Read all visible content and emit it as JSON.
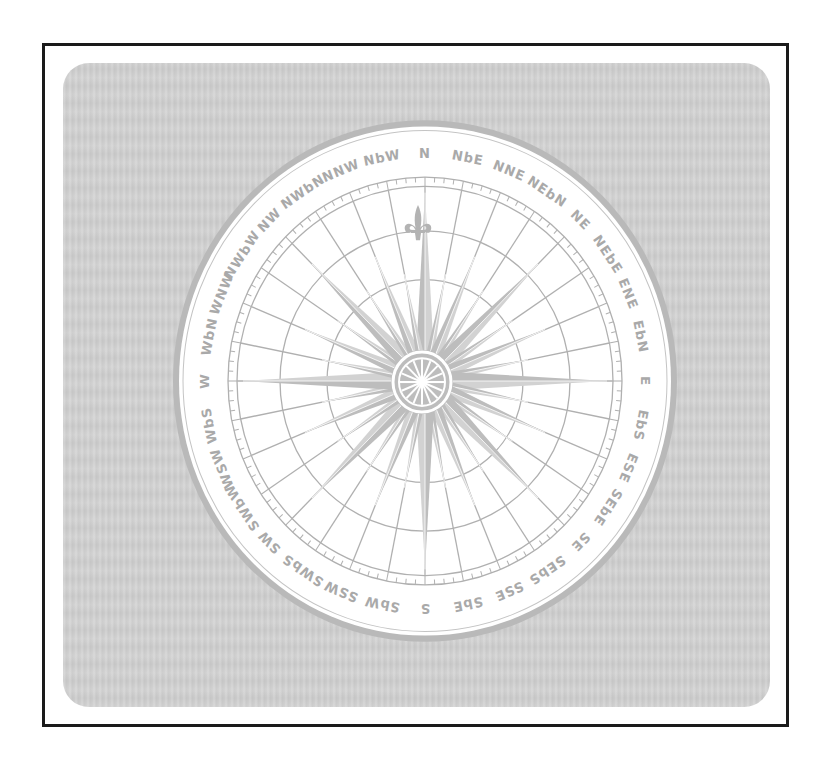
{
  "figure": {
    "colors": {
      "frame_border": "#1a1a1a",
      "panel_background": "#d1d1d1",
      "card_fill": "#ffffff",
      "line_color": "#b0b0b0",
      "label_color": "#a9a9a9",
      "ray_fill": "#bdbdbd"
    },
    "north_marker_icon": "fleur-de-lis-icon",
    "points": [
      "N",
      "NbE",
      "NNE",
      "NEbN",
      "NE",
      "NEbE",
      "ENE",
      "EbN",
      "E",
      "EbS",
      "ESE",
      "SEbE",
      "SE",
      "SEbS",
      "SSE",
      "SbE",
      "S",
      "SbW",
      "SSW",
      "SWbS",
      "SW",
      "SWbW",
      "WSW",
      "WbS",
      "W",
      "WbN",
      "WNW",
      "NWbW",
      "NW",
      "NWbN",
      "NNW",
      "NbW"
    ]
  }
}
